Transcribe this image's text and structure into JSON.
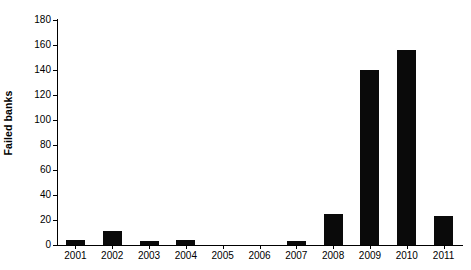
{
  "chart_data": {
    "type": "bar",
    "title": "",
    "subtitle": "",
    "xlabel": "",
    "ylabel": "Failed banks",
    "categories": [
      "2001",
      "2002",
      "2003",
      "2004",
      "2005",
      "2006",
      "2007",
      "2008",
      "2009",
      "2010",
      "2011"
    ],
    "values": [
      4,
      11,
      3,
      4,
      0,
      0,
      3,
      25,
      140,
      156,
      23
    ],
    "ylim": [
      0,
      180
    ],
    "yticks": [
      0,
      20,
      40,
      60,
      80,
      100,
      120,
      140,
      160,
      180
    ],
    "ytick_labels": [
      "0",
      "20",
      "40",
      "60",
      "80",
      "100",
      "120",
      "140",
      "160",
      "180"
    ],
    "grid": false,
    "legend": false,
    "legend_position": "none",
    "bar_color": "#0a0a0a",
    "axis_color": "#000000",
    "background_color": "#ffffff"
  }
}
